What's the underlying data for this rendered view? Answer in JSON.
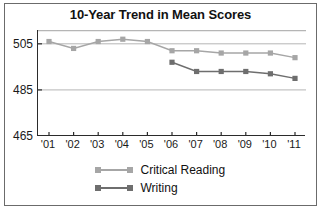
{
  "chart_data": {
    "type": "line",
    "title": "10-Year Trend in Mean Scores",
    "xlabel": "",
    "ylabel": "",
    "categories": [
      "'01",
      "'02",
      "'03",
      "'04",
      "'05",
      "'06",
      "'07",
      "'08",
      "'09",
      "'10",
      "'11"
    ],
    "yticks": [
      465,
      485,
      505
    ],
    "ylim": [
      465,
      511
    ],
    "grid": true,
    "grid_axis": "y",
    "legend_position": "bottom",
    "series": [
      {
        "name": "Critical Reading",
        "color": "#a6a6a6",
        "marker": "square",
        "values": [
          506,
          503,
          506,
          507,
          506,
          502,
          502,
          501,
          501,
          501,
          499
        ]
      },
      {
        "name": "Writing",
        "color": "#6e6e6e",
        "marker": "square",
        "values": [
          null,
          null,
          null,
          null,
          null,
          497,
          493,
          493,
          493,
          492,
          490
        ]
      }
    ]
  },
  "legend": {
    "items": [
      {
        "label": "Critical Reading"
      },
      {
        "label": "Writing"
      }
    ]
  },
  "colors": {
    "critical_reading": "#a6a6a6",
    "writing": "#6e6e6e",
    "axis": "#2b2b2b",
    "grid": "#b5b5b5",
    "border": "#6b6b6b",
    "text": "#111111"
  }
}
